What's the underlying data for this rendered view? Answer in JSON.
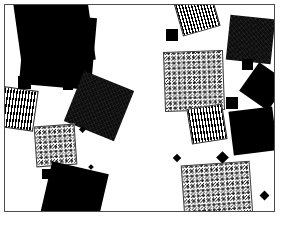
{
  "figure": {
    "title": "",
    "type": "abstract-square-scatter",
    "canvas": {
      "width": 281,
      "height": 228,
      "background": "#ffffff"
    },
    "frame": {
      "name": "plot-border",
      "x": 4,
      "y": 4,
      "width": 271,
      "height": 208,
      "border_color": "#4b4b4b",
      "border_width": 1,
      "fill": "#ffffff"
    },
    "fills": {
      "solid": "#000000",
      "dark_texture": "#0d0d0d",
      "speckle": "#ffffff",
      "speckle_ink": "#1a1a1a",
      "stripe_ink": "#000000",
      "stripe_ground": "#ffffff"
    },
    "shapes": [
      {
        "id": "sq-01",
        "fill": "solid",
        "x": 12,
        "y": -14,
        "size": 74,
        "rotate": -8
      },
      {
        "id": "sq-02",
        "fill": "solid",
        "x": 17,
        "y": 10,
        "size": 72,
        "rotate": 5
      },
      {
        "id": "sq-03",
        "fill": "stripe",
        "x": -10,
        "y": 83,
        "size": 41,
        "rotate": 8
      },
      {
        "id": "sq-04",
        "fill": "dark-tex",
        "x": 67,
        "y": 74,
        "size": 54,
        "rotate": 22
      },
      {
        "id": "sq-05",
        "fill": "speckle",
        "x": 30,
        "y": 120,
        "size": 41,
        "rotate": -4
      },
      {
        "id": "sq-06",
        "fill": "solid",
        "x": 40,
        "y": 162,
        "size": 58,
        "rotate": 13
      },
      {
        "id": "sq-07",
        "fill": "stripe",
        "x": 172,
        "y": -12,
        "size": 39,
        "rotate": -16
      },
      {
        "id": "sq-08",
        "fill": "dark-tex",
        "x": 223,
        "y": 12,
        "size": 45,
        "rotate": 6
      },
      {
        "id": "sq-09",
        "fill": "speckle",
        "x": 159,
        "y": 46,
        "size": 60,
        "rotate": -2
      },
      {
        "id": "sq-10",
        "fill": "solid",
        "x": 241,
        "y": 64,
        "size": 35,
        "rotate": 35
      },
      {
        "id": "sq-11",
        "fill": "stripe",
        "x": 184,
        "y": 101,
        "size": 36,
        "rotate": -9
      },
      {
        "id": "sq-12",
        "fill": "solid",
        "x": 226,
        "y": 104,
        "size": 44,
        "rotate": -7
      },
      {
        "id": "sq-13",
        "fill": "speckle",
        "x": 178,
        "y": 158,
        "size": 69,
        "rotate": -4
      }
    ],
    "markers": [
      {
        "id": "dot-01",
        "x": 11,
        "y": 10,
        "size": 5,
        "rotate": 0
      },
      {
        "id": "dot-02",
        "x": 13,
        "y": 71,
        "size": 13,
        "rotate": 0
      },
      {
        "id": "dot-03",
        "x": 58,
        "y": 75,
        "size": 10,
        "rotate": 0
      },
      {
        "id": "dot-04",
        "x": 75,
        "y": 122,
        "size": 5,
        "rotate": 45
      },
      {
        "id": "dot-05",
        "x": 37,
        "y": 164,
        "size": 10,
        "rotate": 0
      },
      {
        "id": "dot-06",
        "x": 84,
        "y": 160,
        "size": 4,
        "rotate": 45
      },
      {
        "id": "dot-07",
        "x": 161,
        "y": 24,
        "size": 12,
        "rotate": 0
      },
      {
        "id": "dot-08",
        "x": 237,
        "y": 54,
        "size": 11,
        "rotate": 0
      },
      {
        "id": "dot-09",
        "x": 221,
        "y": 92,
        "size": 12,
        "rotate": 0
      },
      {
        "id": "dot-10",
        "x": 169,
        "y": 150,
        "size": 6,
        "rotate": 45
      },
      {
        "id": "dot-11",
        "x": 213,
        "y": 148,
        "size": 9,
        "rotate": 45
      },
      {
        "id": "dot-12",
        "x": 256,
        "y": 187,
        "size": 7,
        "rotate": 45
      }
    ]
  }
}
